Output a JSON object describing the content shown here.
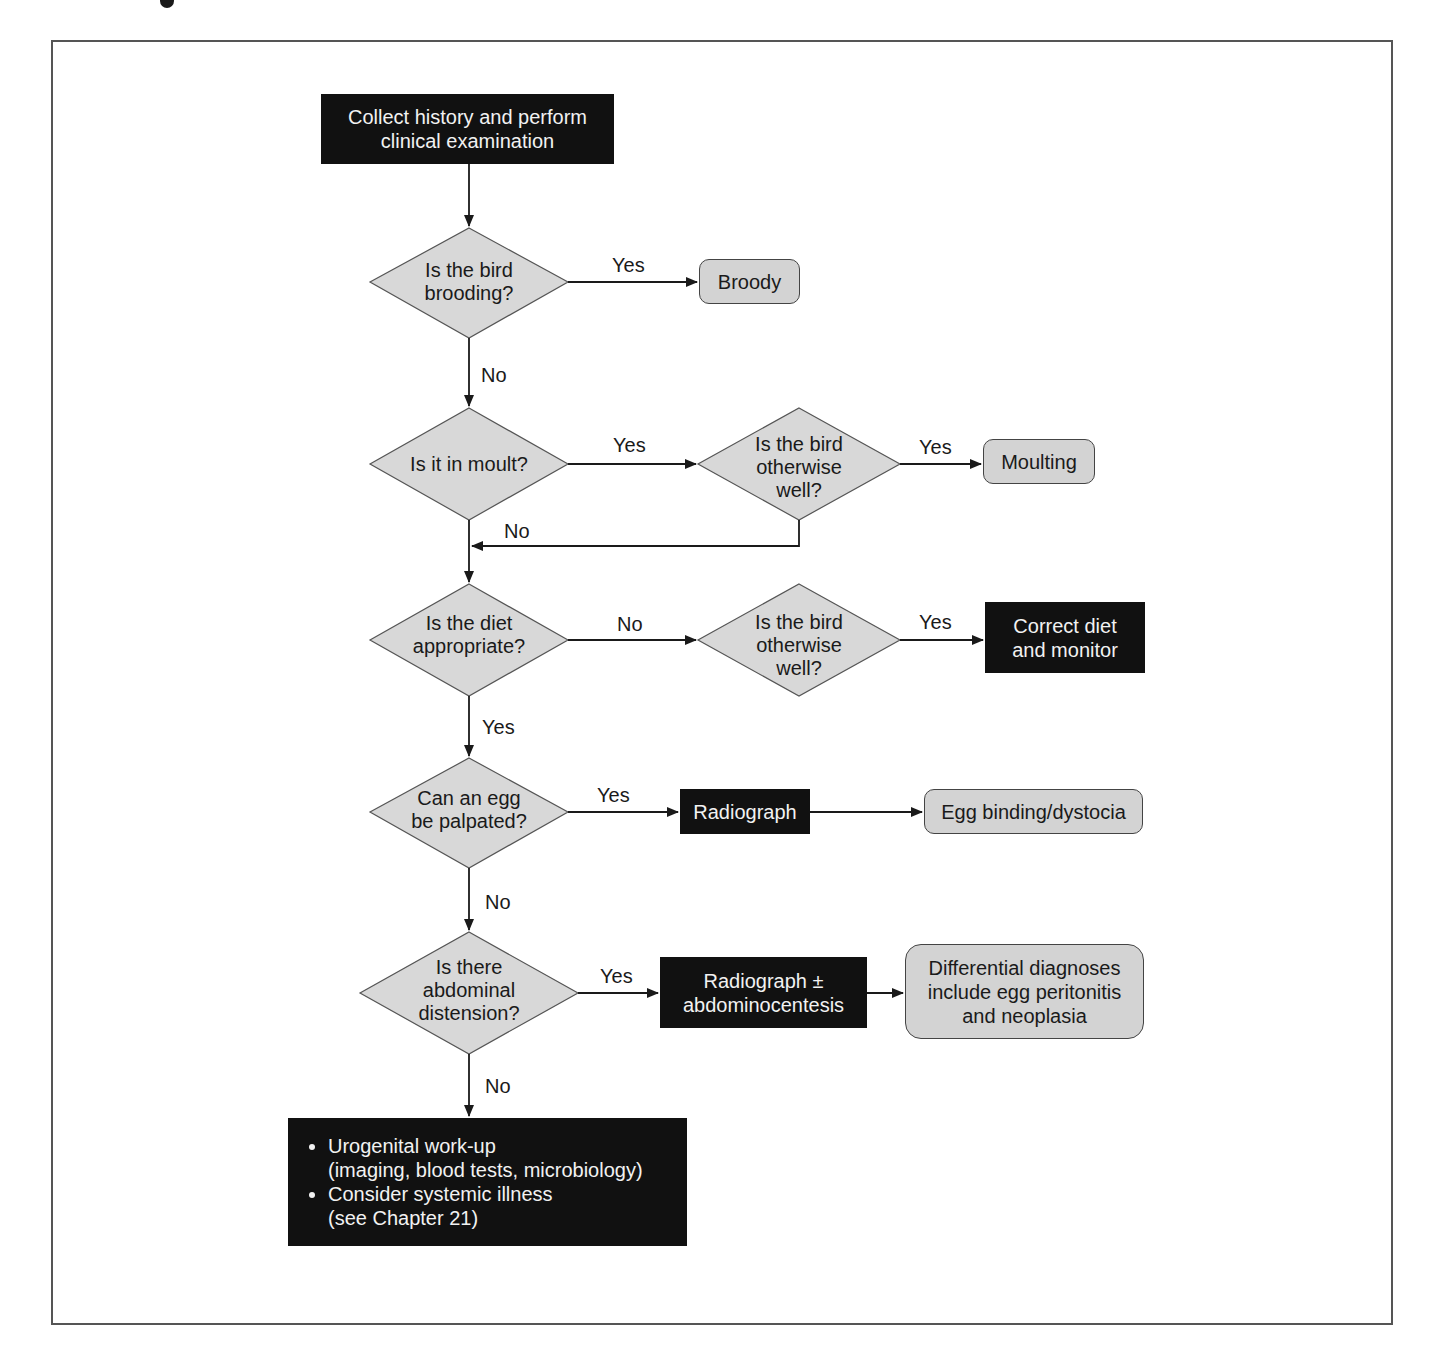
{
  "page": {
    "title_fragment_visible": true
  },
  "colors": {
    "dark_box": "#111111",
    "grey_box": "#d3d3d3",
    "diamond": "#d8d8d8",
    "line": "#1a1a1a",
    "frame": "#555555"
  },
  "nodes": {
    "start": {
      "line1": "Collect history and perform",
      "line2": "clinical examination"
    },
    "q_brooding": {
      "line1": "Is the bird",
      "line2": "brooding?"
    },
    "broody": {
      "label": "Broody"
    },
    "q_moult": {
      "label": "Is it in moult?"
    },
    "q_well_1": {
      "line1": "Is the bird",
      "line2": "otherwise",
      "line3": "well?"
    },
    "moulting": {
      "label": "Moulting"
    },
    "q_diet": {
      "line1": "Is the diet",
      "line2": "appropriate?"
    },
    "q_well_2": {
      "line1": "Is the bird",
      "line2": "otherwise",
      "line3": "well?"
    },
    "correct_diet": {
      "line1": "Correct diet",
      "line2": "and monitor"
    },
    "q_egg": {
      "line1": "Can an egg",
      "line2": "be palpated?"
    },
    "radiograph": {
      "label": "Radiograph"
    },
    "egg_binding": {
      "label": "Egg binding/dystocia"
    },
    "q_distension": {
      "line1": "Is there",
      "line2": "abdominal",
      "line3": "distension?"
    },
    "radiograph_abdo": {
      "line1": "Radiograph ±",
      "line2": "abdominocentesis"
    },
    "differential": {
      "line1": "Differential diagnoses",
      "line2": "include egg peritonitis",
      "line3": "and neoplasia"
    },
    "workup": {
      "items": [
        {
          "line1": "Urogenital work-up",
          "line2": "(imaging, blood tests, microbiology)"
        },
        {
          "line1": "Consider systemic illness",
          "line2": "(see Chapter 21)"
        }
      ]
    }
  },
  "edges": {
    "brooding_yes": "Yes",
    "brooding_no": "No",
    "moult_yes": "Yes",
    "well1_yes": "Yes",
    "well1_no": "No",
    "diet_no": "No",
    "well2_yes": "Yes",
    "diet_yes": "Yes",
    "egg_yes": "Yes",
    "egg_no": "No",
    "distension_yes": "Yes",
    "distension_no": "No"
  }
}
